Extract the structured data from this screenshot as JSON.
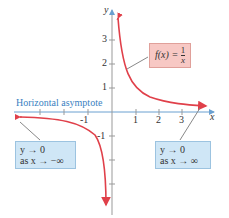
{
  "axes": {
    "x_label": "x",
    "y_label": "y",
    "x_ticks": [
      "-1",
      "1",
      "2",
      "3"
    ],
    "y_ticks": [
      "3",
      "2",
      "1",
      "-1"
    ]
  },
  "function_label": {
    "lhs": "f(x) = ",
    "num": "1",
    "den": "x"
  },
  "asymptote_label": "Horizontal asymptote",
  "left_note": {
    "line1": "y → 0",
    "line2": "as x → −∞"
  },
  "right_note": {
    "line1": "y → 0",
    "line2": "as x → ∞"
  },
  "colors": {
    "curve": "#e0404a",
    "axis": "#6aa0d0",
    "asymptote": "#3a7fc1"
  }
}
